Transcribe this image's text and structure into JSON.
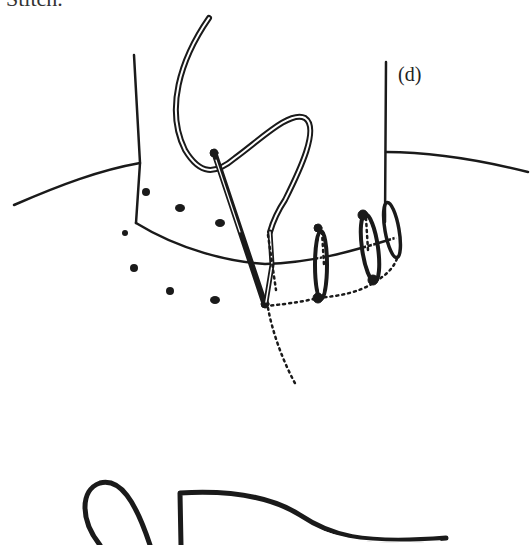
{
  "caption": {
    "text": "Stitch."
  },
  "figure": {
    "label": "(d)",
    "colors": {
      "ink": "#1a1a1a",
      "background": "#ffffff"
    }
  }
}
